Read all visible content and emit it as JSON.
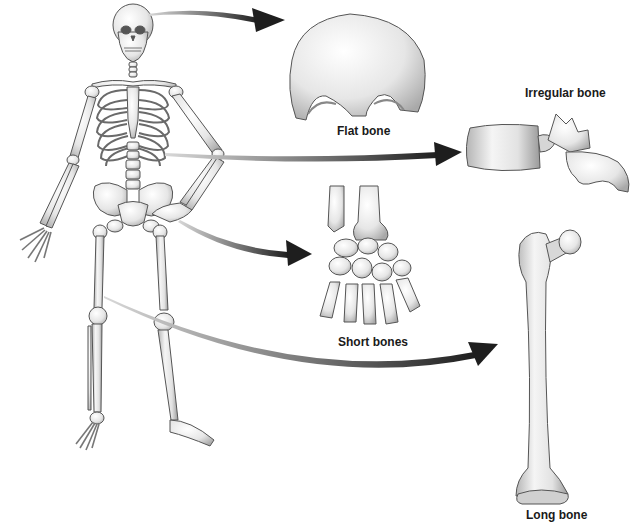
{
  "figure": {
    "labels": {
      "flat": "Flat bone",
      "irregular": "Irregular bone",
      "short": "Short bones",
      "long": "Long bone"
    },
    "items": [
      {
        "key": "flat",
        "label": "Flat bone",
        "example": "frontal bone (skull)",
        "source_region": "skull"
      },
      {
        "key": "irregular",
        "label": "Irregular bone",
        "example": "vertebra",
        "source_region": "vertebral column"
      },
      {
        "key": "short",
        "label": "Short bones",
        "example": "carpals (wrist)",
        "source_region": "wrist"
      },
      {
        "key": "long",
        "label": "Long bone",
        "example": "femur",
        "source_region": "thigh"
      }
    ],
    "colors": {
      "background": "#ffffff",
      "bone_fill": "#eeeeee",
      "bone_shade": "#bdbdbd",
      "bone_outline": "#555555",
      "arrow_dark": "#1e1e1e",
      "arrow_light": "#cfcfcf",
      "label_text": "#1a1a1a"
    }
  }
}
